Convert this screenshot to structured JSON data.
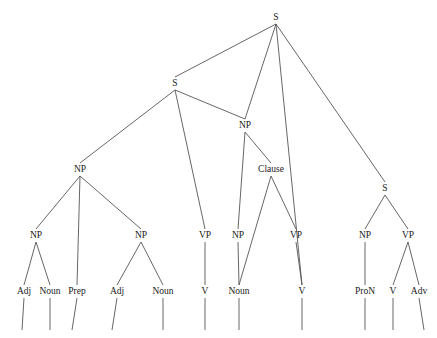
{
  "diagram": {
    "type": "syntax-tree",
    "title": "",
    "nodes": [
      {
        "id": "n0",
        "label": "S",
        "x": 276,
        "y": 20
      },
      {
        "id": "n1",
        "label": "S",
        "x": 175,
        "y": 86
      },
      {
        "id": "n2",
        "label": "NP",
        "x": 245,
        "y": 128
      },
      {
        "id": "n3",
        "label": "S",
        "x": 385,
        "y": 191
      },
      {
        "id": "n4",
        "label": "NP",
        "x": 80,
        "y": 172
      },
      {
        "id": "n5",
        "label": "Clause",
        "x": 271,
        "y": 172
      },
      {
        "id": "n6",
        "label": "NP",
        "x": 36,
        "y": 238
      },
      {
        "id": "n7",
        "label": "NP",
        "x": 141,
        "y": 238
      },
      {
        "id": "n8",
        "label": "VP",
        "x": 205,
        "y": 238
      },
      {
        "id": "n9",
        "label": "NP",
        "x": 238,
        "y": 238
      },
      {
        "id": "n10",
        "label": "VP",
        "x": 296,
        "y": 238
      },
      {
        "id": "n11",
        "label": "NP",
        "x": 365,
        "y": 238
      },
      {
        "id": "n12",
        "label": "VP",
        "x": 408,
        "y": 238
      },
      {
        "id": "n13",
        "label": "Adj",
        "x": 24,
        "y": 294
      },
      {
        "id": "n14",
        "label": "Noun",
        "x": 50,
        "y": 294
      },
      {
        "id": "n15",
        "label": "Prep",
        "x": 77,
        "y": 294
      },
      {
        "id": "n16",
        "label": "Adj",
        "x": 117,
        "y": 294
      },
      {
        "id": "n17",
        "label": "Noun",
        "x": 163,
        "y": 294
      },
      {
        "id": "n18",
        "label": "V",
        "x": 205,
        "y": 294
      },
      {
        "id": "n19",
        "label": "Noun",
        "x": 239,
        "y": 294
      },
      {
        "id": "n20",
        "label": "V",
        "x": 302,
        "y": 294
      },
      {
        "id": "n21",
        "label": "ProN",
        "x": 365,
        "y": 294
      },
      {
        "id": "n22",
        "label": "V",
        "x": 393,
        "y": 294
      },
      {
        "id": "n23",
        "label": "Adv",
        "x": 419,
        "y": 294
      }
    ],
    "edges": [
      {
        "from": "n0",
        "to": "n1"
      },
      {
        "from": "n0",
        "to": "n2"
      },
      {
        "from": "n0",
        "to": "n3"
      },
      {
        "from": "n0",
        "to": "n20_long"
      },
      {
        "from": "n1",
        "to": "n4"
      },
      {
        "from": "n1",
        "to": "n8"
      },
      {
        "from": "n1",
        "to": "n2"
      },
      {
        "from": "n2",
        "to": "n9"
      },
      {
        "from": "n2",
        "to": "n5"
      },
      {
        "from": "n3",
        "to": "n11"
      },
      {
        "from": "n3",
        "to": "n12"
      },
      {
        "from": "n4",
        "to": "n6"
      },
      {
        "from": "n4",
        "to": "n15"
      },
      {
        "from": "n4",
        "to": "n7"
      },
      {
        "from": "n5",
        "to": "n19"
      },
      {
        "from": "n5",
        "to": "n10"
      },
      {
        "from": "n6",
        "to": "n13"
      },
      {
        "from": "n6",
        "to": "n14"
      },
      {
        "from": "n7",
        "to": "n16"
      },
      {
        "from": "n7",
        "to": "n17"
      },
      {
        "from": "n8",
        "to": "n18"
      },
      {
        "from": "n9",
        "to": "n19"
      },
      {
        "from": "n10",
        "to": "n20"
      },
      {
        "from": "n11",
        "to": "n21"
      },
      {
        "from": "n12",
        "to": "n22"
      },
      {
        "from": "n12",
        "to": "n23"
      }
    ],
    "leaf_stems": [
      {
        "x_top": 24,
        "x_bottom": 22,
        "y_top": 298,
        "y_bottom": 330
      },
      {
        "x_top": 50,
        "x_bottom": 50,
        "y_top": 298,
        "y_bottom": 330
      },
      {
        "x_top": 77,
        "x_bottom": 72,
        "y_top": 298,
        "y_bottom": 330
      },
      {
        "x_top": 117,
        "x_bottom": 112,
        "y_top": 298,
        "y_bottom": 330
      },
      {
        "x_top": 163,
        "x_bottom": 163,
        "y_top": 298,
        "y_bottom": 330
      },
      {
        "x_top": 205,
        "x_bottom": 205,
        "y_top": 298,
        "y_bottom": 330
      },
      {
        "x_top": 239,
        "x_bottom": 239,
        "y_top": 298,
        "y_bottom": 330
      },
      {
        "x_top": 302,
        "x_bottom": 302,
        "y_top": 298,
        "y_bottom": 330
      },
      {
        "x_top": 365,
        "x_bottom": 365,
        "y_top": 298,
        "y_bottom": 330
      },
      {
        "x_top": 393,
        "x_bottom": 393,
        "y_top": 298,
        "y_bottom": 330
      },
      {
        "x_top": 419,
        "x_bottom": 424,
        "y_top": 298,
        "y_bottom": 330
      }
    ],
    "colors": {
      "line": "#555555",
      "text": "#1a1a1a",
      "background": "#ffffff"
    }
  }
}
